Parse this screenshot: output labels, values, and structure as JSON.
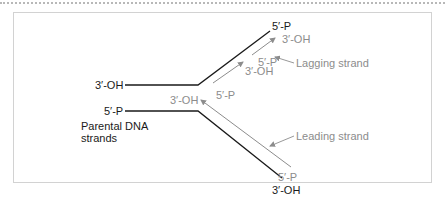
{
  "colors": {
    "parental_strand": "#1a1a1a",
    "daughter_strand": "#8c8c8c",
    "frame_border": "#d2d2d2",
    "dotted_rule": "#b8b8b8"
  },
  "labels": {
    "top_parent_left": "3′-OH",
    "top_parent_right": "5′-P",
    "bottom_parent_left": "5′-P",
    "bottom_parent_right": "3′-OH",
    "parental_caption_line1": "Parental DNA",
    "parental_caption_line2": "strands",
    "lagging_frag1_3end": "3′-OH",
    "lagging_frag1_5end": "5′-P",
    "lagging_frag2_3end": "3′-OH",
    "lagging_frag2_5end": "5′-P",
    "leading_3end": "3′-OH",
    "leading_5end": "5′-P",
    "lagging_callout": "Lagging strand",
    "leading_callout": "Leading strand"
  }
}
